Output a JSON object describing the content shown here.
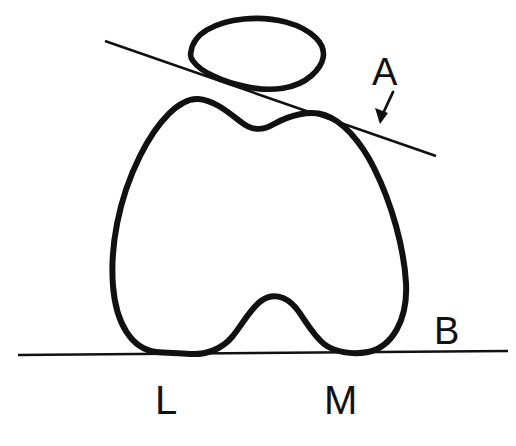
{
  "figure": {
    "background_color": "#ffffff",
    "ink_color": "#111111",
    "width": 516,
    "height": 446
  },
  "labels": {
    "a": "A",
    "b": "B",
    "lateral": "L",
    "medial": "M"
  },
  "shapes": {
    "patella": {
      "name": "patella-outline",
      "stroke_width": 5.6,
      "path": "M 191 52 C 193 34 214 22 244 19 C 274 16 302 24 316 38 C 328 50 325 64 311 76 C 296 89 272 92 248 87 C 221 82 200 71 193 61 C 190 57 190 55 191 52 Z"
    },
    "femoral_condyles": {
      "name": "femoral-condyle-outline",
      "stroke_width": 6,
      "path": "M 156 352 C 132 349 116 324 113 286 C 110 248 118 200 140 156 C 158 120 180 98 198 99 C 214 100 228 112 241 122 C 252 131 262 131 274 124 C 290 115 310 110 325 115 C 342 121 360 140 374 168 C 392 204 404 248 406 283 C 408 320 392 347 368 352 C 352 355 334 352 324 344 C 312 334 304 318 296 308 C 285 295 272 293 261 301 C 250 309 242 325 232 337 C 222 349 206 355 190 354 C 176 353 165 353 156 352 Z"
    },
    "tangent_line_a": {
      "name": "tangent-line-a",
      "stroke_width": 2.6,
      "x1": 105,
      "y1": 41,
      "x2": 436,
      "y2": 156
    },
    "baseline_b": {
      "name": "baseline-b",
      "stroke_width": 2.6,
      "x1": 18,
      "y1": 355,
      "x2": 508,
      "y2": 351
    },
    "arrow_a": {
      "name": "arrow-pointer-a",
      "shaft": {
        "x1": 393,
        "y1": 92,
        "x2": 380,
        "y2": 120
      },
      "head": "M 380 124 L 375 108 L 388 113 Z"
    }
  }
}
